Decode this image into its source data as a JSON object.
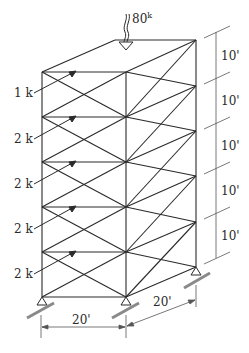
{
  "figure": {
    "type": "space truss / braced tower",
    "top_load": {
      "label": "80",
      "unit": "k"
    },
    "lateral_loads": [
      {
        "label": "1 k",
        "level": 1
      },
      {
        "label": "2 k",
        "level": 2
      },
      {
        "label": "2 k",
        "level": 3
      },
      {
        "label": "2 k",
        "level": 4
      },
      {
        "label": "2 k",
        "level": 5
      }
    ],
    "story_heights": [
      "10'",
      "10'",
      "10'",
      "10'",
      "10'"
    ],
    "base_dimensions": {
      "width": "20'",
      "depth": "20'"
    },
    "colors": {
      "line": "#2a2a2a",
      "dim": "#555555",
      "support": "#8a8a8a"
    }
  }
}
